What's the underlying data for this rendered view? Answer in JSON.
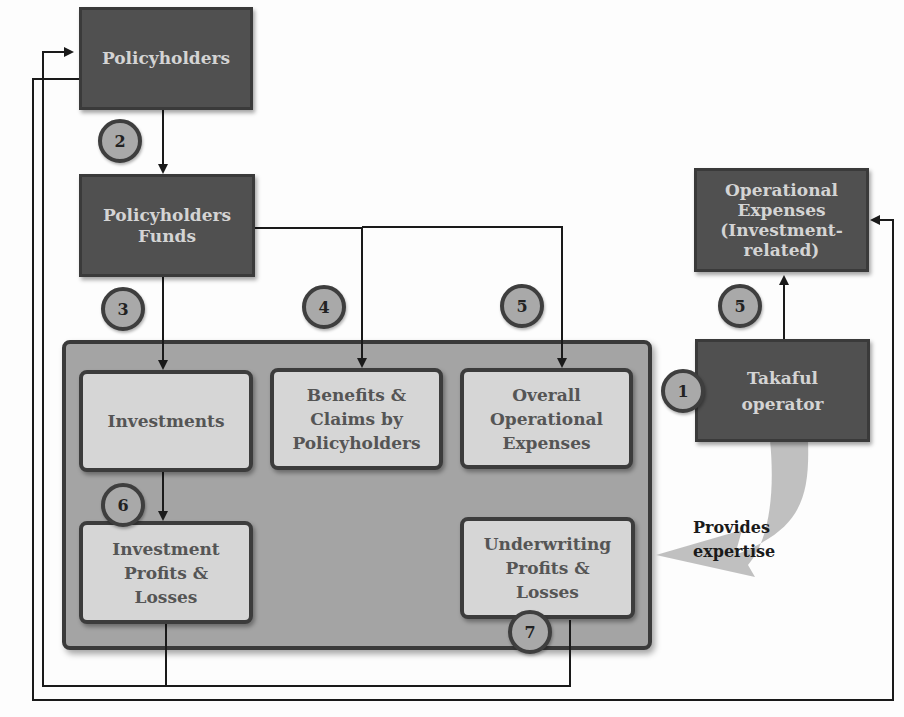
{
  "diagram": {
    "nodes": {
      "policyholders": "Policyholders",
      "policyholders_funds": [
        "Policyholders",
        "Funds"
      ],
      "operational_expenses_investment": [
        "Operational",
        "Expenses",
        "(Investment-",
        "related)"
      ],
      "takaful_operator": [
        "Takaful",
        "operator"
      ],
      "investments": "Investments",
      "benefits_claims": [
        "Benefits &",
        "Claims by",
        "Policyholders"
      ],
      "overall_operational_expenses": [
        "Overall",
        "Operational",
        "Expenses"
      ],
      "investment_profits_losses": [
        "Investment",
        "Profits &",
        "Losses"
      ],
      "underwriting_profits_losses": [
        "Underwriting",
        "Profits &",
        "Losses"
      ]
    },
    "badges": {
      "b1": "1",
      "b2": "2",
      "b3": "3",
      "b4": "4",
      "b5_main": "5",
      "b5_operator": "5",
      "b6": "6",
      "b7": "7"
    },
    "expertise_label": [
      "Provides",
      "expertise"
    ],
    "colors": {
      "dark_box": "#505050",
      "light_box": "#d6d6d6",
      "container": "#a4a4a4",
      "badge": "#a9a9a9",
      "arrow": "#bdbdbd",
      "line": "#1a1a1a"
    }
  }
}
